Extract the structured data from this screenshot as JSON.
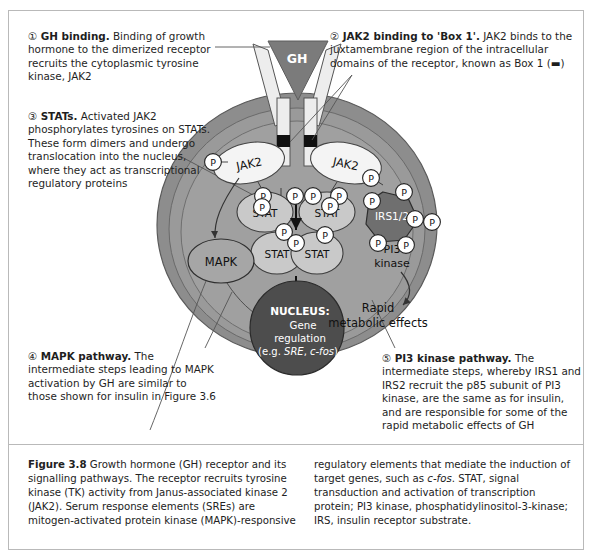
{
  "figure": {
    "id": "Figure 3.8",
    "title": "Growth hormone (GH) receptor and its signalling pathways"
  },
  "annotations": [
    {
      "marker": "①",
      "heading": "GH binding.",
      "body": " Binding of growth hormone to the dimerized receptor recruits the cytoplasmic tyrosine kinase, JAK2"
    },
    {
      "marker": "②",
      "heading": "JAK2 binding to 'Box 1'.",
      "body": " JAK2 binds to the juxtamembrane region of the intracellular domains of the receptor, known as Box 1 (▬)"
    },
    {
      "marker": "③",
      "heading": "STATs.",
      "body": " Activated JAK2 phosphorylates tyrosines on STATs. These form dimers and undergo translocation into the nucleus, where they act as transcriptional regulatory proteins"
    },
    {
      "marker": "④",
      "heading": "MAPK pathway.",
      "body": " The intermediate steps leading to MAPK activation by GH are similar to those shown for insulin in Figure 3.6"
    },
    {
      "marker": "⑤",
      "heading": "PI3 kinase pathway.",
      "body": " The intermediate steps, whereby IRS1 and IRS2 recruit the p85 subunit of PI3 kinase, are the same as for insulin, and are responsible for some of the rapid metabolic effects of GH"
    }
  ],
  "caption": {
    "label": "Figure 3.8",
    "left_text": " Growth hormone (GH) receptor and its signalling pathways. The receptor recruits tyrosine kinase (TK) activity from Janus-associated kinase 2 (JAK2). Serum response elements (SREs) are mitogen-activated protein kinase (MAPK)-responsive",
    "right_pre": "regulatory elements that mediate the induction of target genes, such as ",
    "right_italic": "c-fos",
    "right_post": ". STAT, signal transduction and activation of transcription protein; PI3 kinase, phosphatidylinositol-3-kinase; IRS, insulin receptor substrate."
  },
  "diagram": {
    "ligand_label": "GH",
    "kinase_left_label": "JAK2",
    "kinase_right_label": "JAK2",
    "stat_labels": [
      "STAT",
      "STAT",
      "STAT",
      "STAT"
    ],
    "irs_label": "IRS1/2",
    "mapk_label": "MAPK",
    "pi3_label_line1": "PI3",
    "pi3_label_line2": "kinase",
    "rapid_line1": "Rapid",
    "rapid_line2": "metabolic effects",
    "nucleus_line1": "NUCLEUS:",
    "nucleus_line2": "Gene",
    "nucleus_line3": "regulation",
    "nucleus_line4_pre": "(e.g. ",
    "nucleus_line4_italic1": "SRE",
    "nucleus_line4_mid": ", ",
    "nucleus_line4_italic2": "c-fos",
    "nucleus_line4_post": ")",
    "phosphate_label": "P",
    "phosphate_count": 17
  },
  "colors": {
    "cell_outer_ring": "#8a8a8a",
    "cell_inner": "#9d9d9d",
    "cell_middle": "#949494",
    "nucleus": "#4a4a4a",
    "ligand": "#777777",
    "receptor_arm": "#e8e8e8",
    "box1": "#111111",
    "protein_fill": "#f2f2f2",
    "stat_fill": "#c3c3c3",
    "irs_fill": "#6e6e6e",
    "frame_border": "#b9b9b9"
  }
}
